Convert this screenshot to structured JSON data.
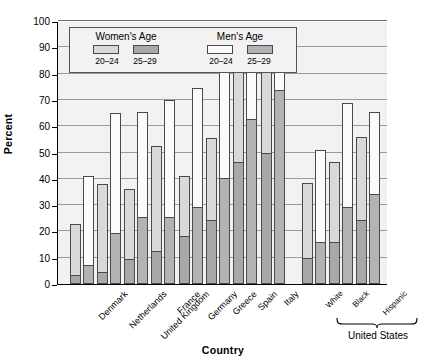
{
  "chart_data": {
    "type": "bar",
    "title": "",
    "xlabel": "Country",
    "ylabel": "Percent",
    "ylim": [
      0,
      100
    ],
    "yticks": [
      0,
      10,
      20,
      30,
      40,
      50,
      60,
      70,
      80,
      90,
      100
    ],
    "grid": true,
    "legend_position": "top-left inside plot",
    "legend": {
      "groups": [
        {
          "name": "Women's Age",
          "entries": [
            {
              "label": "20–24",
              "color": "#d9d9d9"
            },
            {
              "label": "25–29",
              "color": "#a8a8a8"
            }
          ]
        },
        {
          "name": "Men's Age",
          "entries": [
            {
              "label": "20–24",
              "color": "#fbfbfb"
            },
            {
              "label": "25–29",
              "color": "#b3b3b3"
            }
          ]
        }
      ]
    },
    "categories": [
      "Denmark",
      "Netherlands",
      "United Kingdom",
      "France",
      "Germany",
      "Greece",
      "Spain",
      "Italy",
      "White",
      "Black",
      "Hispanic"
    ],
    "group_annotation": {
      "label": "United States",
      "covers": [
        "White",
        "Black",
        "Hispanic"
      ]
    },
    "series": [
      {
        "name": "Women 20–24",
        "values": [
          23,
          38,
          36,
          52.5,
          41,
          55.5,
          88,
          89.5,
          38.5,
          46.5,
          56
        ]
      },
      {
        "name": "Women 25–29",
        "values": [
          3,
          4,
          9,
          12,
          18,
          24,
          46,
          49.5,
          9.5,
          15.5,
          24
        ]
      },
      {
        "name": "Men 20–24",
        "values": [
          41,
          65,
          65.5,
          70,
          74.5,
          81.5,
          94.5,
          96.5,
          51,
          69,
          65.5
        ]
      },
      {
        "name": "Men 25–29",
        "values": [
          7,
          19,
          25,
          25,
          29,
          40,
          62.5,
          73.5,
          15.5,
          29,
          34
        ]
      }
    ]
  }
}
